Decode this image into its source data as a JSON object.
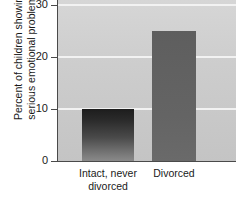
{
  "chart_data": {
    "type": "bar",
    "title": "",
    "xlabel": "",
    "ylabel": "Percent of children showing serious emotional problems",
    "ylabel_lines": [
      "Percent of children showing",
      "serious emotional problems"
    ],
    "categories": [
      "Intact, never divorced",
      "Divorced"
    ],
    "category_lines": [
      [
        "Intact, never",
        "divorced"
      ],
      [
        "Divorced"
      ]
    ],
    "values": [
      10,
      25
    ],
    "ylim": [
      0,
      31
    ],
    "yticks": [
      0,
      10,
      20,
      30
    ],
    "ytick_labels": [
      "0",
      "10",
      "20",
      "30"
    ],
    "grid": true,
    "gridline_values": [
      10,
      20,
      30
    ],
    "legend": "none",
    "colors": {
      "plot_background": "#cdcdcd",
      "gridline": "#f2f2f2",
      "axis": "#4a4a4a",
      "bar_intact": "#2b2b2b",
      "bar_divorced": "#616161",
      "text": "#1a1a1a",
      "page_background": "#ffffff"
    }
  }
}
